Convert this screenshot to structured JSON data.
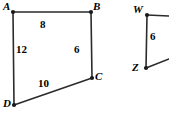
{
  "figure": {
    "type": "geometry-diagram",
    "background_color": "#ffffff",
    "stroke_color": "#2b2b2b",
    "text_color": "#000000",
    "canvas": {
      "width": 169,
      "height": 119
    }
  },
  "shapes": [
    {
      "name": "quadrilateral-abcd",
      "vertices": [
        {
          "id": "A",
          "label": "A",
          "x": 13,
          "y": 12,
          "label_x": 3,
          "label_y": 1
        },
        {
          "id": "B",
          "label": "B",
          "x": 91,
          "y": 12,
          "label_x": 93,
          "label_y": 1
        },
        {
          "id": "C",
          "label": "C",
          "x": 92,
          "y": 78,
          "label_x": 95,
          "label_y": 71
        },
        {
          "id": "D",
          "label": "D",
          "x": 14,
          "y": 105,
          "label_x": 3,
          "label_y": 98
        }
      ],
      "sides": [
        {
          "from": "A",
          "to": "B",
          "length": "8",
          "label_x": 40,
          "label_y": 19
        },
        {
          "from": "B",
          "to": "C",
          "length": "6",
          "label_x": 74,
          "label_y": 44
        },
        {
          "from": "C",
          "to": "D",
          "length": "10",
          "label_x": 38,
          "label_y": 78
        },
        {
          "from": "D",
          "to": "A",
          "length": "12",
          "label_x": 16,
          "label_y": 44
        }
      ]
    },
    {
      "name": "partial-figure-wz",
      "vertices": [
        {
          "id": "W",
          "label": "W",
          "x": 147,
          "y": 15,
          "label_x": 133,
          "label_y": 4
        },
        {
          "id": "Z",
          "label": "Z",
          "x": 146,
          "y": 68,
          "label_x": 132,
          "label_y": 62
        }
      ],
      "sides": [
        {
          "from": "W",
          "to": "Z",
          "length": "6",
          "label_x": 150,
          "label_y": 31
        }
      ],
      "open_edges": [
        {
          "name": "w-to-right-edge",
          "from": "W",
          "x2": 169,
          "y2": 16
        },
        {
          "name": "z-to-right-edge",
          "from": "Z",
          "x2": 169,
          "y2": 59
        }
      ]
    }
  ]
}
